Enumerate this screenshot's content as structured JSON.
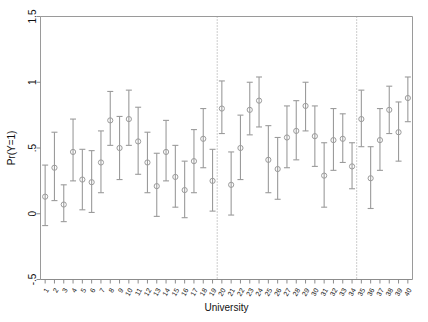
{
  "chart_data": {
    "type": "scatter",
    "title": "",
    "xlabel": "University",
    "ylabel": "Pr(Y=1)",
    "ylim": [
      -0.5,
      1.5
    ],
    "yticks": [
      -0.5,
      0,
      0.5,
      1,
      1.5
    ],
    "ytick_labels": [
      "-.5",
      "0",
      ".5",
      "1",
      "1.5"
    ],
    "grid": false,
    "legend": null,
    "marker": "open-circle",
    "error_bars": "95% confidence interval",
    "vertical_reference_lines": [
      19.5,
      34.5
    ],
    "categories": [
      1,
      2,
      3,
      4,
      5,
      6,
      7,
      8,
      9,
      10,
      11,
      12,
      13,
      14,
      15,
      16,
      17,
      18,
      19,
      20,
      21,
      22,
      23,
      24,
      25,
      26,
      27,
      28,
      29,
      30,
      31,
      32,
      33,
      34,
      35,
      36,
      37,
      38,
      39,
      40
    ],
    "xtick_labels": [
      "1",
      "2",
      "3",
      "4",
      "5",
      "6",
      "7",
      "8",
      "9",
      "10",
      "11",
      "12",
      "13",
      "14",
      "15",
      "16",
      "17",
      "18",
      "19",
      "20",
      "21",
      "22",
      "23",
      "24",
      "25",
      "26",
      "27",
      "28",
      "29",
      "30",
      "31",
      "32",
      "33",
      "34",
      "35",
      "36",
      "37",
      "38",
      "39",
      "40"
    ],
    "series": [
      {
        "name": "Pr(Y=1)",
        "values": [
          0.13,
          0.35,
          0.07,
          0.47,
          0.26,
          0.24,
          0.39,
          0.71,
          0.5,
          0.72,
          0.55,
          0.39,
          0.21,
          0.47,
          0.28,
          0.18,
          0.4,
          0.57,
          0.25,
          0.8,
          0.22,
          0.5,
          0.79,
          0.86,
          0.41,
          0.34,
          0.58,
          0.63,
          0.82,
          0.59,
          0.29,
          0.56,
          0.57,
          0.36,
          0.72,
          0.27,
          0.56,
          0.79,
          0.62,
          0.88
        ],
        "ci_lower": [
          -0.09,
          0.1,
          -0.06,
          0.25,
          0.03,
          0.01,
          0.16,
          0.52,
          0.26,
          0.52,
          0.3,
          0.16,
          -0.02,
          0.25,
          0.05,
          -0.03,
          0.16,
          0.35,
          0.02,
          0.61,
          -0.01,
          0.26,
          0.6,
          0.66,
          0.16,
          0.11,
          0.35,
          0.41,
          0.63,
          0.36,
          0.05,
          0.33,
          0.39,
          0.19,
          0.51,
          0.04,
          0.33,
          0.61,
          0.4,
          0.7
        ],
        "ci_upper": [
          0.37,
          0.62,
          0.22,
          0.72,
          0.49,
          0.48,
          0.63,
          0.93,
          0.74,
          0.94,
          0.81,
          0.62,
          0.46,
          0.71,
          0.52,
          0.4,
          0.64,
          0.8,
          0.49,
          1.01,
          0.47,
          0.75,
          1.0,
          1.04,
          0.67,
          0.58,
          0.82,
          0.86,
          1.0,
          0.82,
          0.54,
          0.8,
          0.76,
          0.54,
          0.94,
          0.51,
          0.8,
          0.97,
          0.85,
          1.04
        ]
      }
    ]
  }
}
